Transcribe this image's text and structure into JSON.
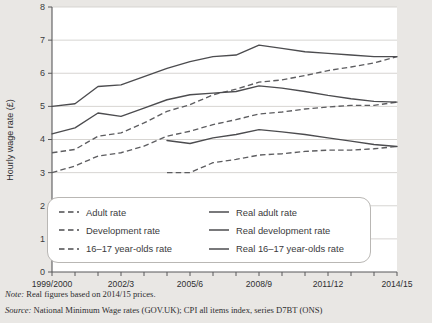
{
  "chart_data": {
    "type": "line",
    "title": "",
    "xlabel": "",
    "ylabel": "Hourly wage rate (£)",
    "ylim": [
      0,
      8
    ],
    "yticks": [
      0,
      1,
      2,
      3,
      4,
      5,
      6,
      7,
      8
    ],
    "grid": true,
    "legend_position": "inside-bottom-left",
    "x": [
      "1999/2000",
      "2000/1",
      "2001/2",
      "2002/3",
      "2003/4",
      "2004/5",
      "2005/6",
      "2006/7",
      "2007/8",
      "2008/9",
      "2009/10",
      "2010/11",
      "2011/12",
      "2012/13",
      "2013/14",
      "2014/15"
    ],
    "xtick_labels": [
      "1999/2000",
      "2002/3",
      "2005/6",
      "2008/9",
      "2011/12",
      "2014/15"
    ],
    "series": [
      {
        "name": "Adult rate",
        "style": "dashed",
        "values": [
          3.6,
          3.7,
          4.1,
          4.2,
          4.5,
          4.85,
          5.05,
          5.35,
          5.52,
          5.73,
          5.8,
          5.93,
          6.08,
          6.19,
          6.31,
          6.5
        ]
      },
      {
        "name": "Development rate",
        "style": "dashed",
        "values": [
          3.0,
          3.2,
          3.5,
          3.6,
          3.8,
          4.1,
          4.25,
          4.45,
          4.6,
          4.77,
          4.83,
          4.92,
          4.98,
          5.03,
          5.03,
          5.13
        ]
      },
      {
        "name": "16–17 year-olds rate",
        "style": "dashed",
        "values": [
          null,
          null,
          null,
          null,
          null,
          3.0,
          3.0,
          3.3,
          3.4,
          3.53,
          3.57,
          3.64,
          3.68,
          3.68,
          3.72,
          3.79
        ]
      },
      {
        "name": "Real adult rate",
        "style": "solid",
        "values": [
          5.0,
          5.08,
          5.6,
          5.65,
          5.9,
          6.15,
          6.35,
          6.5,
          6.55,
          6.85,
          6.75,
          6.65,
          6.6,
          6.55,
          6.5,
          6.5
        ]
      },
      {
        "name": "Real development rate",
        "style": "solid",
        "values": [
          4.17,
          4.35,
          4.8,
          4.7,
          4.95,
          5.2,
          5.35,
          5.4,
          5.45,
          5.62,
          5.55,
          5.45,
          5.33,
          5.23,
          5.15,
          5.13
        ]
      },
      {
        "name": "Real 16–17 year-olds rate",
        "style": "solid",
        "values": [
          null,
          null,
          null,
          null,
          null,
          3.97,
          3.88,
          4.05,
          4.15,
          4.3,
          4.23,
          4.15,
          4.05,
          3.95,
          3.85,
          3.79
        ]
      }
    ]
  },
  "legend": {
    "items": [
      {
        "label": "Adult rate",
        "style": "dashed"
      },
      {
        "label": "Real adult rate",
        "style": "solid"
      },
      {
        "label": "Development rate",
        "style": "dashed"
      },
      {
        "label": "Real development rate",
        "style": "solid"
      },
      {
        "label": "16–17 year-olds rate",
        "style": "dashed"
      },
      {
        "label": "Real 16–17 year-olds rate",
        "style": "solid"
      }
    ]
  },
  "footnotes": {
    "note_lead": "Note:",
    "note_body": " Real figures based on 2014/15 prices.",
    "source_lead": "Source:",
    "source_body": " National Minimum Wage rates (GOV.UK); CPI all items index, series D7BT (ONS)"
  },
  "colors": {
    "background": "#e9e7e4",
    "plot_background": "#ffffff",
    "line": "#4c4c4f",
    "grid": "#d2d0cd",
    "axis": "#58585a"
  }
}
